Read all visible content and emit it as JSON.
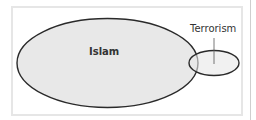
{
  "diagram": {
    "type": "euler",
    "sets": [
      {
        "id": "islam",
        "label": "Islam",
        "fill": "#e8e8e8",
        "stroke": "#2a2a2a"
      },
      {
        "id": "terrorism",
        "label": "Terrorism",
        "fill": "#e8e8e8",
        "stroke": "#2a2a2a"
      }
    ],
    "overlap": [
      "islam",
      "terrorism"
    ]
  }
}
